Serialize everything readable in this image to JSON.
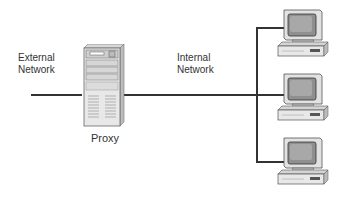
{
  "diagram": {
    "type": "network-topology",
    "labels": {
      "external": "External\nNetwork",
      "external_line1": "External",
      "external_line2": "Network",
      "internal_line1": "Internal",
      "internal_line2": "Network",
      "proxy": "Proxy"
    },
    "nodes": [
      {
        "id": "proxy",
        "kind": "server-tower",
        "label": "Proxy"
      },
      {
        "id": "client-1",
        "kind": "desktop-computer"
      },
      {
        "id": "client-2",
        "kind": "desktop-computer"
      },
      {
        "id": "client-3",
        "kind": "desktop-computer"
      }
    ],
    "edges": [
      {
        "from": "external-network",
        "to": "proxy"
      },
      {
        "from": "proxy",
        "to": "internal-bus"
      },
      {
        "from": "internal-bus",
        "to": "client-1"
      },
      {
        "from": "internal-bus",
        "to": "client-2"
      },
      {
        "from": "internal-bus",
        "to": "client-3"
      }
    ],
    "colors": {
      "line": "#333333",
      "device_light": "#e6e6e6",
      "device_dark": "#555555",
      "screen": "#9a9a9a"
    }
  }
}
